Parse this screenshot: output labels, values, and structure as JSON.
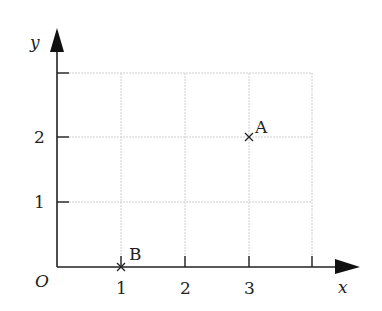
{
  "diagram": {
    "type": "coordinate-grid",
    "axes": {
      "x_label": "x",
      "y_label": "y",
      "origin_label": "O",
      "x_ticks": [
        "1",
        "2",
        "3"
      ],
      "y_ticks": [
        "1",
        "2"
      ]
    },
    "grid": {
      "x_range": [
        0,
        4
      ],
      "y_range": [
        0,
        3
      ],
      "line_color": "#c8c8c8"
    },
    "points": [
      {
        "label": "A",
        "x": 3,
        "y": 2,
        "marker": "×"
      },
      {
        "label": "B",
        "x": 1,
        "y": 0,
        "marker": "×"
      }
    ],
    "colors": {
      "axis": "#222222",
      "text": "#222222"
    }
  }
}
